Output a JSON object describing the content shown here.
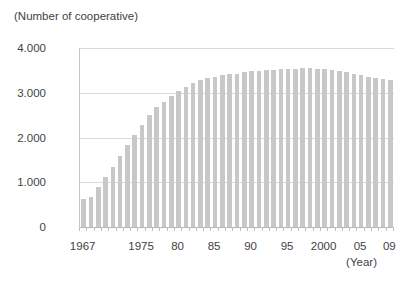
{
  "chart_data": {
    "type": "bar",
    "title": "(Number of cooperative)",
    "xlabel": "(Year)",
    "ylabel": "",
    "legend": "none",
    "grid": "horizontal",
    "ylim": [
      0,
      4000
    ],
    "yticks": [
      {
        "value": 0,
        "label": "0"
      },
      {
        "value": 1000,
        "label": "1.000"
      },
      {
        "value": 2000,
        "label": "2.000"
      },
      {
        "value": 3000,
        "label": "3.000"
      },
      {
        "value": 4000,
        "label": "4.000"
      }
    ],
    "categories": [
      "1967",
      "1968",
      "1969",
      "1970",
      "1971",
      "1972",
      "1973",
      "1974",
      "1975",
      "1976",
      "1977",
      "1978",
      "1979",
      "1980",
      "1981",
      "1982",
      "1983",
      "1984",
      "1985",
      "1986",
      "1987",
      "1988",
      "1989",
      "1990",
      "1991",
      "1992",
      "1993",
      "1994",
      "1995",
      "1996",
      "1997",
      "1998",
      "1999",
      "2000",
      "2001",
      "2002",
      "2003",
      "2004",
      "2005",
      "2006",
      "2007",
      "2008",
      "2009"
    ],
    "values": [
      620,
      680,
      900,
      1120,
      1350,
      1580,
      1830,
      2060,
      2280,
      2500,
      2680,
      2800,
      2920,
      3050,
      3120,
      3220,
      3290,
      3330,
      3360,
      3390,
      3410,
      3430,
      3470,
      3480,
      3490,
      3500,
      3510,
      3520,
      3530,
      3540,
      3550,
      3550,
      3540,
      3520,
      3500,
      3480,
      3460,
      3430,
      3390,
      3360,
      3340,
      3310,
      3290
    ],
    "x_axis_labels": [
      {
        "index": 0,
        "label": "1967"
      },
      {
        "index": 8,
        "label": "1975"
      },
      {
        "index": 13,
        "label": "80"
      },
      {
        "index": 18,
        "label": "85"
      },
      {
        "index": 23,
        "label": "90"
      },
      {
        "index": 28,
        "label": "95"
      },
      {
        "index": 33,
        "label": "2000"
      },
      {
        "index": 38,
        "label": "05"
      },
      {
        "index": 42,
        "label": "09"
      }
    ],
    "colors": {
      "bar": "#c8c8c8",
      "gridline": "#d9d9d9",
      "axis": "#bfbfbf",
      "text": "#3f3f3f",
      "background": "#ffffff"
    }
  }
}
